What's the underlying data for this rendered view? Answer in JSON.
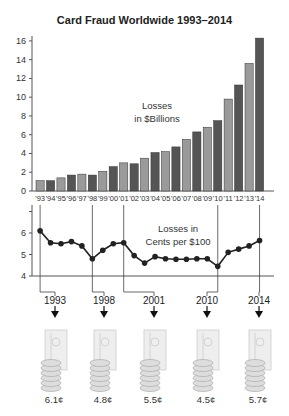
{
  "chart_data": [
    {
      "type": "bar",
      "title": "Card Fraud Worldwide 1993–2014",
      "annotation": "Losses in $Billions",
      "categories": [
        "'93",
        "'94",
        "'95",
        "'96",
        "'97",
        "'98",
        "'99",
        "'00",
        "'01",
        "'02",
        "'03",
        "'04",
        "'05",
        "'06",
        "'07",
        "'08",
        "'09",
        "'10",
        "'11",
        "'12",
        "'13",
        "'14"
      ],
      "values": [
        1.1,
        1.1,
        1.4,
        1.7,
        1.8,
        1.7,
        2.1,
        2.6,
        3.0,
        2.9,
        3.5,
        4.1,
        4.2,
        4.7,
        5.5,
        6.3,
        6.8,
        7.5,
        9.8,
        11.3,
        13.6,
        16.3
      ],
      "yticks": [
        0,
        2,
        4,
        6,
        8,
        10,
        12,
        14,
        16
      ],
      "ylim": [
        0,
        16.5
      ],
      "bar_colors": [
        "#9a9a9a",
        "#555555"
      ],
      "grid": false
    },
    {
      "type": "line",
      "annotation_line1": "Losses in",
      "annotation_line2": "Cents per $100",
      "categories": [
        "'93",
        "'94",
        "'95",
        "'96",
        "'97",
        "'98",
        "'99",
        "'00",
        "'01",
        "'02",
        "'03",
        "'04",
        "'05",
        "'06",
        "'07",
        "'08",
        "'09",
        "'10",
        "'11",
        "'12",
        "'13",
        "'14"
      ],
      "values": [
        6.1,
        5.55,
        5.5,
        5.6,
        5.4,
        4.8,
        5.2,
        5.5,
        5.55,
        4.95,
        4.6,
        4.9,
        4.8,
        4.78,
        4.78,
        4.8,
        4.8,
        4.45,
        5.1,
        5.25,
        5.4,
        5.65
      ],
      "yticks": [
        4,
        5,
        6
      ],
      "ylim": [
        4,
        7
      ],
      "highlighted_years": [
        {
          "year": "1993",
          "index": 0,
          "value_label": "6.1¢"
        },
        {
          "year": "1998",
          "index": 5,
          "value_label": "4.8¢"
        },
        {
          "year": "2001",
          "index": 8,
          "value_label": "5.5¢"
        },
        {
          "year": "2010",
          "index": 17,
          "value_label": "4.5¢"
        },
        {
          "year": "2014",
          "index": 21,
          "value_label": "5.7¢"
        }
      ]
    }
  ],
  "header": {
    "title": "Card Fraud Worldwide 1993–2014"
  }
}
